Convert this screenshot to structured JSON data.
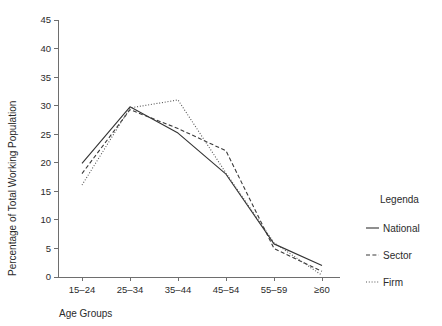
{
  "chart_data": {
    "type": "line",
    "title": "",
    "subtitle": "",
    "xlabel": "Age Groups",
    "ylabel": "Percentage of Total Working Population",
    "categories": [
      "15–24",
      "25–34",
      "35–44",
      "45–54",
      "55–59",
      "≥60"
    ],
    "ylim": [
      0,
      45
    ],
    "yticks": [
      0,
      5,
      10,
      15,
      20,
      25,
      30,
      35,
      40,
      45
    ],
    "ytick_labels": [
      "0",
      "5",
      "10",
      "15",
      "20",
      "25",
      "30",
      "35",
      "40",
      "45"
    ],
    "grid": false,
    "legend_position": "right",
    "series": [
      {
        "name": "National",
        "style": "solid",
        "color": "#333333",
        "values": [
          19.9,
          29.8,
          25.2,
          18.0,
          5.8,
          2.0
        ]
      },
      {
        "name": "Sector",
        "style": "dashed",
        "color": "#3a3a3a",
        "values": [
          18.1,
          29.3,
          26.0,
          22.1,
          5.0,
          1.0
        ]
      },
      {
        "name": "Firm",
        "style": "dotted",
        "color": "#555555",
        "values": [
          16.1,
          29.6,
          31.0,
          18.2,
          6.0,
          0.3
        ]
      }
    ]
  },
  "legend": {
    "title": "Legenda",
    "entries": [
      {
        "label": "National",
        "style": "solid"
      },
      {
        "label": "Sector",
        "style": "dashed"
      },
      {
        "label": "Firm",
        "style": "dotted"
      }
    ]
  }
}
